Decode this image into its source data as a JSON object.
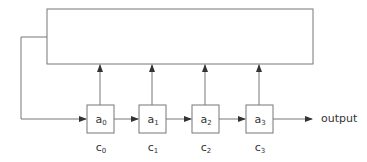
{
  "diagram": {
    "type": "linear feedback shift register",
    "stroke_color": "#666666",
    "registers": [
      {
        "name": "a",
        "sub": "0",
        "x": 87
      },
      {
        "name": "a",
        "sub": "1",
        "x": 139
      },
      {
        "name": "a",
        "sub": "2",
        "x": 192
      },
      {
        "name": "a",
        "sub": "3",
        "x": 246
      }
    ],
    "coefficients": [
      {
        "name": "c",
        "sub": "0"
      },
      {
        "name": "c",
        "sub": "1"
      },
      {
        "name": "c",
        "sub": "2"
      },
      {
        "name": "c",
        "sub": "3"
      }
    ],
    "output_label": "output"
  }
}
